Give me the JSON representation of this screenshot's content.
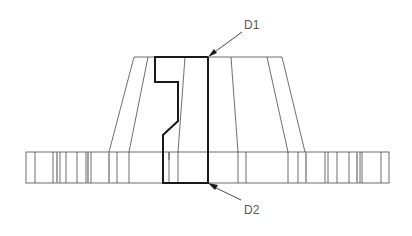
{
  "diagram": {
    "type": "technical-drawing",
    "labels": [
      {
        "id": "D1",
        "text": "D1",
        "x": 244,
        "y": 29
      },
      {
        "id": "D2",
        "text": "D2",
        "x": 244,
        "y": 214
      }
    ],
    "hub": {
      "top_left": [
        134,
        57
      ],
      "top_right": [
        282,
        57
      ],
      "bottom_left": [
        109,
        152
      ],
      "bottom_right": [
        305,
        152
      ]
    },
    "flange": {
      "x": 26,
      "y": 152,
      "width": 363,
      "height": 31
    },
    "colors": {
      "line": "#4a4a4a",
      "bold": "#1a1a1a",
      "text": "#555555",
      "background": "#ffffff"
    }
  }
}
